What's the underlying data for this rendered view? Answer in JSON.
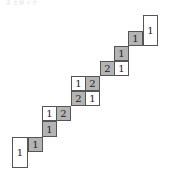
{
  "caption": "き と 分 ド ク",
  "colors": {
    "shaded": "#b4b4b4",
    "plain": "#ffffff",
    "border": "#555555"
  },
  "cells": [
    {
      "label": "1",
      "shade": "white",
      "x": 143,
      "y": 15,
      "w": 15,
      "h": 31
    },
    {
      "label": "1",
      "shade": "gray",
      "x": 128,
      "y": 31,
      "w": 15,
      "h": 15
    },
    {
      "label": "1",
      "shade": "gray",
      "x": 114,
      "y": 46,
      "w": 15,
      "h": 15
    },
    {
      "label": "2",
      "shade": "gray",
      "x": 100,
      "y": 61,
      "w": 15,
      "h": 15
    },
    {
      "label": "1",
      "shade": "white",
      "x": 114,
      "y": 61,
      "w": 15,
      "h": 15
    },
    {
      "label": "1",
      "shade": "white",
      "x": 71,
      "y": 76,
      "w": 15,
      "h": 15
    },
    {
      "label": "2",
      "shade": "gray",
      "x": 85,
      "y": 76,
      "w": 15,
      "h": 15
    },
    {
      "label": "2",
      "shade": "gray",
      "x": 71,
      "y": 91,
      "w": 15,
      "h": 15
    },
    {
      "label": "1",
      "shade": "white",
      "x": 85,
      "y": 91,
      "w": 15,
      "h": 15
    },
    {
      "label": "1",
      "shade": "white",
      "x": 42,
      "y": 106,
      "w": 15,
      "h": 15
    },
    {
      "label": "2",
      "shade": "gray",
      "x": 56,
      "y": 106,
      "w": 15,
      "h": 15
    },
    {
      "label": "1",
      "shade": "gray",
      "x": 42,
      "y": 121,
      "w": 15,
      "h": 16
    },
    {
      "label": "1",
      "shade": "gray",
      "x": 28,
      "y": 137,
      "w": 15,
      "h": 15
    },
    {
      "label": "1",
      "shade": "white",
      "x": 12,
      "y": 137,
      "w": 16,
      "h": 31
    }
  ]
}
